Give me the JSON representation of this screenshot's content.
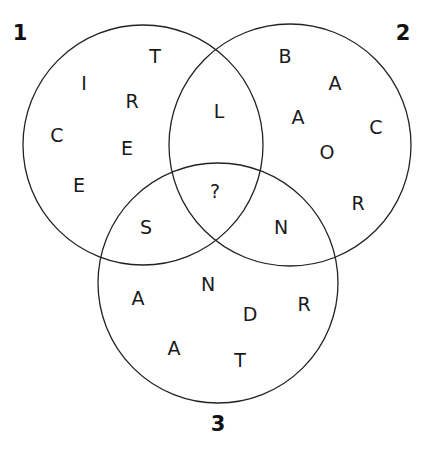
{
  "diagram": {
    "type": "venn",
    "stroke_color": "#222222",
    "circles": [
      {
        "label": "1",
        "cx": 143,
        "cy": 145,
        "r": 120,
        "label_x": 20,
        "label_y": 40
      },
      {
        "label": "2",
        "cx": 290,
        "cy": 145,
        "r": 121,
        "label_x": 403,
        "label_y": 40
      },
      {
        "label": "3",
        "cx": 218,
        "cy": 283,
        "r": 120,
        "label_x": 218,
        "label_y": 431
      }
    ],
    "letters": [
      {
        "region": "1-only",
        "char": "T",
        "x": 155,
        "y": 63
      },
      {
        "region": "1-only",
        "char": "I",
        "x": 84,
        "y": 90
      },
      {
        "region": "1-only",
        "char": "R",
        "x": 132,
        "y": 108
      },
      {
        "region": "1-only",
        "char": "C",
        "x": 57,
        "y": 142
      },
      {
        "region": "1-only",
        "char": "E",
        "x": 127,
        "y": 155
      },
      {
        "region": "1-only",
        "char": "E",
        "x": 79,
        "y": 192
      },
      {
        "region": "1-and-2",
        "char": "L",
        "x": 219,
        "y": 118
      },
      {
        "region": "1-2-3",
        "char": "?",
        "x": 215,
        "y": 198
      },
      {
        "region": "1-and-3",
        "char": "S",
        "x": 146,
        "y": 234
      },
      {
        "region": "2-and-3",
        "char": "N",
        "x": 281,
        "y": 234
      },
      {
        "region": "2-only",
        "char": "B",
        "x": 285,
        "y": 63
      },
      {
        "region": "2-only",
        "char": "A",
        "x": 335,
        "y": 90
      },
      {
        "region": "2-only",
        "char": "A",
        "x": 298,
        "y": 124
      },
      {
        "region": "2-only",
        "char": "C",
        "x": 376,
        "y": 134
      },
      {
        "region": "2-only",
        "char": "O",
        "x": 327,
        "y": 159
      },
      {
        "region": "2-only",
        "char": "R",
        "x": 358,
        "y": 210
      },
      {
        "region": "3-only",
        "char": "N",
        "x": 208,
        "y": 291
      },
      {
        "region": "3-only",
        "char": "A",
        "x": 138,
        "y": 305
      },
      {
        "region": "3-only",
        "char": "D",
        "x": 250,
        "y": 321
      },
      {
        "region": "3-only",
        "char": "R",
        "x": 304,
        "y": 311
      },
      {
        "region": "3-only",
        "char": "A",
        "x": 174,
        "y": 355
      },
      {
        "region": "3-only",
        "char": "T",
        "x": 240,
        "y": 367
      }
    ]
  }
}
